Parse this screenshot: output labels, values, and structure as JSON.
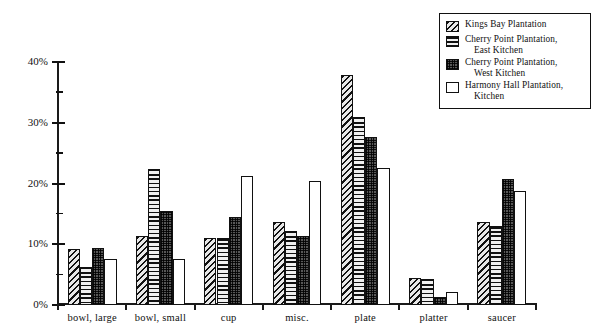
{
  "chart_data": {
    "type": "bar",
    "title": "",
    "xlabel": "",
    "ylabel": "",
    "ylim": [
      0,
      40
    ],
    "ytick_labels": [
      "0%",
      "10%",
      "20%",
      "30%",
      "40%"
    ],
    "ytick_values": [
      0,
      10,
      20,
      30,
      40
    ],
    "yminor_values": [
      5,
      15,
      25,
      35
    ],
    "grid": false,
    "legend_position": "top-right",
    "categories": [
      "bowl, large",
      "bowl, small",
      "cup",
      "misc.",
      "plate",
      "platter",
      "saucer"
    ],
    "series": [
      {
        "name": "Kings Bay Plantation",
        "pattern": "diagonal-hatch",
        "values": [
          9.2,
          11.3,
          11.0,
          13.7,
          37.8,
          4.5,
          13.7
        ]
      },
      {
        "name": "Cherry Point Plantation, East Kitchen",
        "name_line1": "Cherry Point Plantation,",
        "name_line2": "East Kitchen",
        "pattern": "horizontal-hatch",
        "values": [
          6.3,
          22.4,
          11.0,
          12.2,
          30.9,
          4.3,
          13.0
        ]
      },
      {
        "name": "Cherry Point Plantation, West Kitchen",
        "name_line1": "Cherry Point Plantation,",
        "name_line2": "West Kitchen",
        "pattern": "dotted-fill",
        "values": [
          9.4,
          15.4,
          14.5,
          11.3,
          27.6,
          1.3,
          20.7
        ]
      },
      {
        "name": "Harmony Hall Plantation, Kitchen",
        "name_line1": "Harmony Hall Plantation,",
        "name_line2": "Kitchen",
        "pattern": "open-white",
        "values": [
          7.6,
          7.6,
          21.3,
          20.4,
          22.6,
          2.1,
          18.7
        ]
      }
    ]
  },
  "legend": {
    "items": [
      {
        "label": "Kings Bay Plantation",
        "line1": "Kings Bay Plantation",
        "line2": ""
      },
      {
        "label": "Cherry Point Plantation, East Kitchen",
        "line1": "Cherry Point Plantation,",
        "line2": "East Kitchen"
      },
      {
        "label": "Cherry Point Plantation, West Kitchen",
        "line1": "Cherry Point Plantation,",
        "line2": "West Kitchen"
      },
      {
        "label": "Harmony Hall Plantation, Kitchen",
        "line1": "Harmony Hall Plantation,",
        "line2": "Kitchen"
      }
    ]
  },
  "colors": {
    "ink": "#111111",
    "background": "#ffffff"
  }
}
